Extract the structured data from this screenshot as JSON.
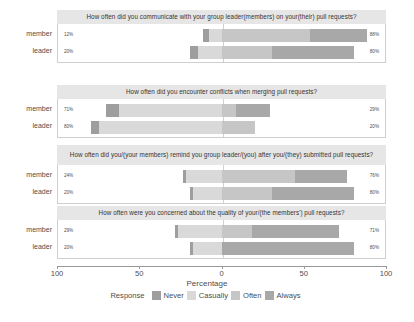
{
  "chart_data": {
    "type": "bar",
    "subtype": "diverging-stacked-likert",
    "title": "",
    "xlabel": "Percentage",
    "ylabel": "",
    "xlim": [
      -100,
      100
    ],
    "xticks": [
      -100,
      -50,
      0,
      50,
      100
    ],
    "xticklabels": [
      "100",
      "50",
      "0",
      "50",
      "100"
    ],
    "grid": false,
    "legend_position": "bottom",
    "legend_title": "Response",
    "categories": [
      "member",
      "leader"
    ],
    "legend": [
      "Never",
      "Casually",
      "Often",
      "Always"
    ],
    "colors": {
      "Never": "#9e9e9e",
      "Casually": "#d9d9d9",
      "Often": "#c6c6c6",
      "Always": "#a8a8a8",
      "strip_bg": "#e6e6e6",
      "panel_border": "#cfcfcf",
      "zero_line": "#d0d0d0",
      "text": "#4d4d4d"
    },
    "panels": [
      {
        "title": "How often did you communicate with your group leader(members) on your(their) pull requests?",
        "rows": [
          {
            "category": "member",
            "left_label": "12%",
            "right_label": "88%",
            "segments": [
              {
                "response": "Never",
                "value": 4
              },
              {
                "response": "Casually",
                "value": 8
              },
              {
                "response": "Often",
                "value": 53
              },
              {
                "response": "Always",
                "value": 35
              }
            ],
            "negative_total": 12,
            "positive_total": 88
          },
          {
            "category": "leader",
            "left_label": "20%",
            "right_label": "80%",
            "segments": [
              {
                "response": "Never",
                "value": 5
              },
              {
                "response": "Casually",
                "value": 15
              },
              {
                "response": "Often",
                "value": 30
              },
              {
                "response": "Always",
                "value": 50
              }
            ],
            "negative_total": 20,
            "positive_total": 80
          }
        ]
      },
      {
        "title": "How often did you encounter conflicts when merging pull requests?",
        "rows": [
          {
            "category": "member",
            "left_label": "71%",
            "right_label": "29%",
            "segments": [
              {
                "response": "Never",
                "value": 8
              },
              {
                "response": "Casually",
                "value": 63
              },
              {
                "response": "Often",
                "value": 8
              },
              {
                "response": "Always",
                "value": 21
              }
            ],
            "negative_total": 71,
            "positive_total": 29
          },
          {
            "category": "leader",
            "left_label": "80%",
            "right_label": "20%",
            "segments": [
              {
                "response": "Never",
                "value": 5
              },
              {
                "response": "Casually",
                "value": 75
              },
              {
                "response": "Often",
                "value": 20
              },
              {
                "response": "Always",
                "value": 0
              }
            ],
            "negative_total": 80,
            "positive_total": 20
          }
        ]
      },
      {
        "title": "How often did you/(your members) remind you group leader/(you) after you/(they) submitted pull requests?",
        "rows": [
          {
            "category": "member",
            "left_label": "24%",
            "right_label": "76%",
            "segments": [
              {
                "response": "Never",
                "value": 2
              },
              {
                "response": "Casually",
                "value": 22
              },
              {
                "response": "Often",
                "value": 44
              },
              {
                "response": "Always",
                "value": 32
              }
            ],
            "negative_total": 24,
            "positive_total": 76
          },
          {
            "category": "leader",
            "left_label": "20%",
            "right_label": "80%",
            "segments": [
              {
                "response": "Never",
                "value": 2
              },
              {
                "response": "Casually",
                "value": 18
              },
              {
                "response": "Often",
                "value": 30
              },
              {
                "response": "Always",
                "value": 50
              }
            ],
            "negative_total": 20,
            "positive_total": 80
          }
        ]
      },
      {
        "title": "How often were you concerned about the quality of your/(the members') pull requests?",
        "rows": [
          {
            "category": "member",
            "left_label": "29%",
            "right_label": "71%",
            "segments": [
              {
                "response": "Never",
                "value": 2
              },
              {
                "response": "Casually",
                "value": 27
              },
              {
                "response": "Often",
                "value": 18
              },
              {
                "response": "Always",
                "value": 53
              }
            ],
            "negative_total": 29,
            "positive_total": 71
          },
          {
            "category": "leader",
            "left_label": "20%",
            "right_label": "80%",
            "segments": [
              {
                "response": "Never",
                "value": 2
              },
              {
                "response": "Casually",
                "value": 18
              },
              {
                "response": "Often",
                "value": 0
              },
              {
                "response": "Always",
                "value": 80
              }
            ],
            "negative_total": 20,
            "positive_total": 80
          }
        ]
      }
    ]
  }
}
